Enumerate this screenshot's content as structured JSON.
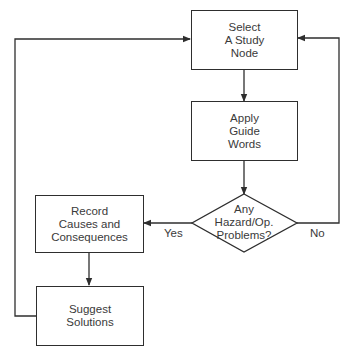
{
  "diagram": {
    "type": "flowchart",
    "nodes": {
      "select": {
        "lines": [
          "Select",
          "A Study",
          "Node"
        ],
        "shape": "rectangle"
      },
      "apply": {
        "lines": [
          "Apply",
          "Guide",
          "Words"
        ],
        "shape": "rectangle"
      },
      "decision": {
        "lines": [
          "Any",
          "Hazard/Op.",
          "Problems?"
        ],
        "shape": "diamond"
      },
      "record": {
        "lines": [
          "Record",
          "Causes and",
          "Consequences"
        ],
        "shape": "rectangle"
      },
      "suggest": {
        "lines": [
          "Suggest",
          "Solutions"
        ],
        "shape": "rectangle"
      }
    },
    "edges": [
      {
        "from": "select",
        "to": "apply",
        "label": ""
      },
      {
        "from": "apply",
        "to": "decision",
        "label": ""
      },
      {
        "from": "decision",
        "to": "record",
        "label": "Yes"
      },
      {
        "from": "decision",
        "to": "select",
        "label": "No"
      },
      {
        "from": "record",
        "to": "suggest",
        "label": ""
      },
      {
        "from": "suggest",
        "to": "select",
        "label": ""
      }
    ],
    "edge_labels": {
      "yes": "Yes",
      "no": "No"
    },
    "line_color": "#2e2e2e"
  }
}
